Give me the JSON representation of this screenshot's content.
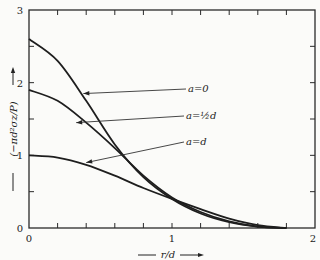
{
  "chart_data": {
    "type": "line",
    "title": "",
    "xlabel": "r/d",
    "ylabel": "(−πd²σz/P)",
    "xlim": [
      0,
      2
    ],
    "ylim": [
      0,
      3
    ],
    "x_ticks": [
      0,
      1,
      2
    ],
    "y_ticks": [
      0,
      1,
      2,
      3
    ],
    "x_minor_step": 0.2,
    "y_minor_step": 0.5,
    "grid": false,
    "legend": "inline annotations with leader lines",
    "x": [
      0,
      0.2,
      0.4,
      0.6,
      0.8,
      1.0,
      1.2,
      1.4,
      1.6,
      1.8
    ],
    "series": [
      {
        "name": "a = 0",
        "label": "a=0",
        "values": [
          2.6,
          2.3,
          1.75,
          1.15,
          0.7,
          0.4,
          0.2,
          0.08,
          0.02,
          0.0
        ]
      },
      {
        "name": "a = ½d",
        "label": "a=½d",
        "values": [
          1.9,
          1.75,
          1.45,
          1.1,
          0.72,
          0.42,
          0.22,
          0.09,
          0.02,
          0.0
        ]
      },
      {
        "name": "a = d",
        "label": "a=d",
        "values": [
          1.0,
          0.97,
          0.87,
          0.72,
          0.55,
          0.4,
          0.26,
          0.13,
          0.04,
          0.0
        ]
      }
    ],
    "annotations": [
      {
        "text": "a=0",
        "points_to_series": "a = 0",
        "arrow_target": [
          0.38,
          1.85
        ]
      },
      {
        "text": "a=½d",
        "points_to_series": "a = ½d",
        "arrow_target": [
          0.33,
          1.45
        ]
      },
      {
        "text": "a=d",
        "points_to_series": "a = d",
        "arrow_target": [
          0.4,
          0.9
        ]
      }
    ]
  },
  "labels": {
    "x_axis": "r/d",
    "y_axis": "(−πd²σz/P)",
    "tick_x": [
      "0",
      "1",
      "2"
    ],
    "tick_y": [
      "0",
      "1",
      "2",
      "3"
    ],
    "annot_a0": "a=0",
    "annot_ahalf": "a=½d",
    "annot_ad": "a=d"
  }
}
